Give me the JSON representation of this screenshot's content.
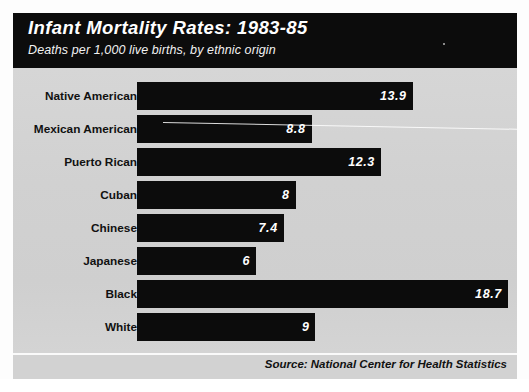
{
  "header": {
    "title": "Infant Mortality Rates: 1983-85",
    "subtitle": "Deaths per 1,000 live births, by ethnic origin"
  },
  "footer": {
    "source": "Source: National Center for Health Statistics"
  },
  "colors": {
    "bar": "#0c0c0c",
    "panel_background": "#d2d2d2",
    "header_background": "#0c0c0c",
    "value_text": "#ffffff",
    "label_text": "#111111"
  },
  "chart_data": {
    "type": "bar",
    "orientation": "horizontal",
    "title": "Infant Mortality Rates: 1983-85",
    "subtitle": "Deaths per 1,000 live births, by ethnic origin",
    "xlabel": "Deaths per 1,000 live births",
    "ylabel": "",
    "xlim": [
      0,
      18.7
    ],
    "grid": false,
    "legend": "none",
    "source": "Source: National Center for Health Statistics",
    "categories": [
      "Native American",
      "Mexican American",
      "Puerto Rican",
      "Cuban",
      "Chinese",
      "Japanese",
      "Black",
      "White"
    ],
    "values": [
      13.9,
      8.8,
      12.3,
      8,
      7.4,
      6,
      18.7,
      9
    ],
    "value_labels": [
      "13.9",
      "8.8",
      "12.3",
      "8",
      "7.4",
      "6",
      "18.7",
      "9"
    ],
    "bars": [
      {
        "label": "Native American",
        "value": 13.9,
        "value_label": "13.9"
      },
      {
        "label": "Mexican American",
        "value": 8.8,
        "value_label": "8.8"
      },
      {
        "label": "Puerto Rican",
        "value": 12.3,
        "value_label": "12.3"
      },
      {
        "label": "Cuban",
        "value": 8,
        "value_label": "8"
      },
      {
        "label": "Chinese",
        "value": 7.4,
        "value_label": "7.4"
      },
      {
        "label": "Japanese",
        "value": 6,
        "value_label": "6"
      },
      {
        "label": "Black",
        "value": 18.7,
        "value_label": "18.7"
      },
      {
        "label": "White",
        "value": 9,
        "value_label": "9"
      }
    ]
  }
}
